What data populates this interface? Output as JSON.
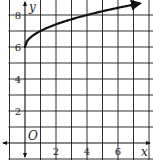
{
  "chart_data": {
    "type": "line",
    "title": "",
    "xlabel": "x",
    "ylabel": "y",
    "origin_label": "O",
    "xlim": [
      -1,
      8
    ],
    "ylim": [
      -1,
      9
    ],
    "grid": true,
    "grid_step": 1,
    "x_ticks": [
      {
        "value": 2,
        "label": "2"
      },
      {
        "value": 4,
        "label": "4"
      },
      {
        "value": 6,
        "label": "6"
      }
    ],
    "y_ticks": [
      {
        "value": 2,
        "label": "2"
      },
      {
        "value": 4,
        "label": "4"
      },
      {
        "value": 6,
        "label": "6"
      },
      {
        "value": 8,
        "label": "8"
      }
    ],
    "series": [
      {
        "name": "y = √x + 6",
        "function": "sqrt(x) + 6",
        "domain": [
          0,
          7.4
        ],
        "arrow_end": true,
        "points": [
          {
            "x": 0,
            "y": 6
          },
          {
            "x": 1,
            "y": 7
          },
          {
            "x": 2,
            "y": 7.41
          },
          {
            "x": 4,
            "y": 8
          },
          {
            "x": 6,
            "y": 8.45
          },
          {
            "x": 7.4,
            "y": 8.72
          }
        ]
      }
    ]
  }
}
